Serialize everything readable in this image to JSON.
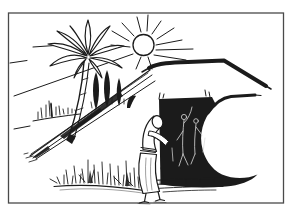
{
  "meta": {
    "type": "black-and-white ink illustration"
  },
  "colors": {
    "paper": "#ffffff",
    "ink": "#1b1b1b",
    "frame": "#4a4a4a",
    "relief": "#d8d8d8"
  },
  "scene": {
    "frame": "thin rectangular border",
    "sun": "sun disc with radiating rays",
    "haze": "horizontal haze dashes at left",
    "palm_tree": "palm tree with starburst crown and curved trunk",
    "cypresses": "dark cypress trees on the slope",
    "reeds": "distant reeds on a low bank",
    "hillside": "diagonal hillside slope lines",
    "ridge": "thick flat-topped mountain ridge",
    "lower_ridge": "second ridge line above the doorway",
    "doorway": "dark tomb doorway with sweeping black base",
    "reliefs": "faint carved figures inside the dark doorway",
    "threshold": "hatched stone threshold steps",
    "figure": "stooping person peering into the doorway",
    "grass": "tufts of grass along the ground"
  }
}
